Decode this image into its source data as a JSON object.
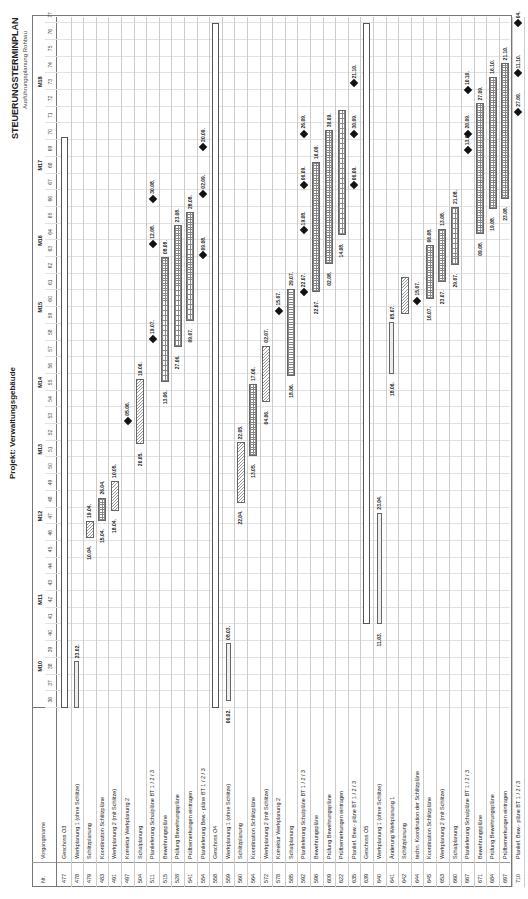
{
  "header": {
    "title": "STEUERUNGSTERMINPLAN",
    "subtitle": "Ausführungsplanung Rohbau",
    "project": "Projekt: Verwaltungsgebäude"
  },
  "columns": {
    "nr": "Nr.",
    "name": "Vorgangsname"
  },
  "timeline": {
    "weeks": [
      "36",
      "37",
      "38",
      "39",
      "40",
      "41",
      "42",
      "43",
      "44",
      "45",
      "46",
      "47",
      "48",
      "49",
      "50",
      "51",
      "52",
      "53",
      "54",
      "55",
      "56",
      "57",
      "58",
      "59",
      "60",
      "61",
      "62",
      "63",
      "64",
      "65",
      "66",
      "67",
      "68",
      "69",
      "70",
      "71",
      "72",
      "73",
      "74",
      "75",
      "76",
      "77"
    ],
    "months": [
      {
        "label": "M10",
        "week": 38.5
      },
      {
        "label": "M11",
        "week": 42.5
      },
      {
        "label": "M12",
        "week": 47.5
      },
      {
        "label": "M13",
        "week": 51.5
      },
      {
        "label": "M14",
        "week": 55.5
      },
      {
        "label": "M15",
        "week": 60
      },
      {
        "label": "M16",
        "week": 64
      },
      {
        "label": "M17",
        "week": 68.5
      },
      {
        "label": "M18",
        "week": 73.5
      }
    ]
  },
  "rows": [
    {
      "nr": "477",
      "name": "Geschoss O3"
    },
    {
      "nr": "478",
      "name": "Werkplanung 1 (ohne Schlitze)"
    },
    {
      "nr": "479",
      "name": "Schlitzplanung"
    },
    {
      "nr": "483",
      "name": "Koordination Schlitzpläne"
    },
    {
      "nr": "491",
      "name": "Werkplanung 2 (mit Schlitze)"
    },
    {
      "nr": "497",
      "name": "Korrektur Werkplanung 2"
    },
    {
      "nr": "504",
      "name": "Schalplanung"
    },
    {
      "nr": "511",
      "name": "Planlieferung Schalpläne BT 1 / 2 / 3"
    },
    {
      "nr": "515",
      "name": "Bewehrungspläne"
    },
    {
      "nr": "528",
      "name": "Prüfung Bewehrungspläne"
    },
    {
      "nr": "541",
      "name": "Prüfbemerkungen eintragen"
    },
    {
      "nr": "554",
      "name": "Planlieferung Bew.- pläne BT 1 / 2 / 3"
    },
    {
      "nr": "558",
      "name": "Geschoss O4"
    },
    {
      "nr": "559",
      "name": "Werkplanung 1 (ohne Schlitze)"
    },
    {
      "nr": "560",
      "name": "Schlitzplanung"
    },
    {
      "nr": "564",
      "name": "Koordination Schlitzpläne"
    },
    {
      "nr": "572",
      "name": "Werkplanung 2 (mit Schlitze)"
    },
    {
      "nr": "578",
      "name": "Korrektur Werkplanung 2"
    },
    {
      "nr": "585",
      "name": "Schalplanung"
    },
    {
      "nr": "592",
      "name": "Planlieferung Schalpläne BT 1 / 2 / 3"
    },
    {
      "nr": "596",
      "name": "Bewehrungspläne"
    },
    {
      "nr": "609",
      "name": "Prüfung Bewehrungspläne"
    },
    {
      "nr": "622",
      "name": "Prüfbemerkungen eintragen"
    },
    {
      "nr": "635",
      "name": "Planlief. Bew.- pläne BT 1 / 2 / 3"
    },
    {
      "nr": "639",
      "name": "Geschoss O5"
    },
    {
      "nr": "640",
      "name": "Werkplanung 1 (ohne Schlitze)"
    },
    {
      "nr": "641",
      "name": "Änderung Werkplanung 1"
    },
    {
      "nr": "642",
      "name": "Schlitzplanung"
    },
    {
      "nr": "644",
      "name": "techn. Koordination der Schlitzpläne"
    },
    {
      "nr": "645",
      "name": "Koordination Schlitzpläne"
    },
    {
      "nr": "653",
      "name": "Werkplanung 2 (mit Schlitze)"
    },
    {
      "nr": "660",
      "name": "Schalplanung"
    },
    {
      "nr": "667",
      "name": "Planlieferung Schalpläne BT 1 / 2 / 3"
    },
    {
      "nr": "671",
      "name": "Bewehrungspläne"
    },
    {
      "nr": "684",
      "name": "Prüfung Bewehrungspläne"
    },
    {
      "nr": "697",
      "name": "Prüfbemerkungen eintragen"
    },
    {
      "nr": "710",
      "name": "Planlief. Bew.- pläne BT 1 / 2 / 3"
    }
  ],
  "chart_data": {
    "type": "gantt",
    "title": "STEUERUNGSTERMINPLAN",
    "subtitle": "Ausführungsplanung Rohbau",
    "project": "Projekt: Verwaltungsgebäude",
    "x_axis": {
      "unit": "week",
      "range": [
        36,
        77
      ],
      "month_labels": [
        "M10",
        "M11",
        "M12",
        "M13",
        "M14",
        "M15",
        "M16",
        "M17",
        "M18"
      ]
    },
    "tasks": [
      {
        "row": 0,
        "type": "summary",
        "start_week": 36,
        "end_week": 70.2
      },
      {
        "row": 1,
        "type": "bar",
        "pattern": "thin",
        "start_week": 36,
        "end_week": 38.8,
        "end_label": "23.02."
      },
      {
        "row": 2,
        "type": "bar",
        "pattern": "hatch",
        "start_week": 46.2,
        "end_week": 47.2,
        "start_label": "10.04.",
        "end_label": "19.04."
      },
      {
        "row": 3,
        "type": "bar",
        "pattern": "grid",
        "start_week": 47.2,
        "end_week": 48.6,
        "start_label": "15.04.",
        "end_label": "26.04."
      },
      {
        "row": 4,
        "type": "bar",
        "pattern": "hatch",
        "start_week": 47.8,
        "end_week": 49.6,
        "start_label": "18.04.",
        "end_label": "10.05."
      },
      {
        "row": 5,
        "type": "milestone",
        "week": 53.2,
        "label": "05.06."
      },
      {
        "row": 6,
        "type": "milestone",
        "week": 54.3,
        "label": "12.06."
      },
      {
        "row": 6,
        "type": "bar",
        "pattern": "hatch",
        "start_week": 51.8,
        "end_week": 55.7,
        "start_label": "20.05.",
        "end_label": "19.06."
      },
      {
        "row": 7,
        "type": "milestone",
        "week": 58.1,
        "label": "19.07."
      },
      {
        "row": 8,
        "type": "bar",
        "pattern": "grid",
        "start_week": 55.5,
        "end_week": 63.0,
        "start_label": "13.06.",
        "end_label": "08.08."
      },
      {
        "row": 9,
        "type": "bar",
        "pattern": "grid",
        "start_week": 57.6,
        "end_week": 64.9,
        "start_label": "27.06.",
        "end_label": "23.08."
      },
      {
        "row": 10,
        "type": "bar",
        "pattern": "grid",
        "start_week": 59.2,
        "end_week": 65.7,
        "start_label": "09.07.",
        "end_label": "28.08."
      },
      {
        "row": 7,
        "type": "milestone",
        "week": 63.8,
        "label": "12.08."
      },
      {
        "row": 7,
        "type": "milestone",
        "week": 66.5,
        "label": "30.08."
      },
      {
        "row": 11,
        "type": "milestone",
        "week": 63.1,
        "label": "09.08."
      },
      {
        "row": 11,
        "type": "milestone",
        "week": 66.8,
        "label": "02.09."
      },
      {
        "row": 11,
        "type": "milestone",
        "week": 69.6,
        "label": "20.09."
      },
      {
        "row": 12,
        "type": "summary",
        "start_week": 36,
        "end_week": 77
      },
      {
        "row": 13,
        "type": "bar",
        "pattern": "thin",
        "start_week": 36.4,
        "end_week": 39.9,
        "start_label": "06.02.",
        "end_label": "08.03."
      },
      {
        "row": 14,
        "type": "bar",
        "pattern": "hatch",
        "start_week": 48.3,
        "end_week": 51.9,
        "start_label": "22.04.",
        "end_label": "22.05."
      },
      {
        "row": 15,
        "type": "bar",
        "pattern": "grid",
        "start_week": 51.1,
        "end_week": 55.4,
        "start_label": "13.05.",
        "end_label": "17.06."
      },
      {
        "row": 16,
        "type": "bar",
        "pattern": "hatch",
        "start_week": 54.3,
        "end_week": 57.7,
        "start_label": "04.06.",
        "end_label": "02.07."
      },
      {
        "row": 17,
        "type": "milestone",
        "week": 59.8,
        "label": "15.07."
      },
      {
        "row": 18,
        "type": "bar",
        "pattern": "grid",
        "start_week": 55.9,
        "end_week": 61.1,
        "start_label": "18.06.",
        "end_label": "29.07."
      },
      {
        "row": 19,
        "type": "milestone",
        "week": 60.9,
        "label": "22.07."
      },
      {
        "row": 19,
        "type": "milestone",
        "week": 64.6,
        "label": "19.08."
      },
      {
        "row": 19,
        "type": "milestone",
        "week": 67.3,
        "label": "06.09."
      },
      {
        "row": 19,
        "type": "milestone",
        "week": 70.4,
        "label": "26.09."
      },
      {
        "row": 20,
        "type": "bar",
        "pattern": "grid",
        "start_week": 60.9,
        "end_week": 68.7,
        "start_label": "22.07.",
        "end_label": "16.09."
      },
      {
        "row": 21,
        "type": "bar",
        "pattern": "grid",
        "start_week": 62.6,
        "end_week": 70.6,
        "start_label": "02.08.",
        "end_label": "30.09."
      },
      {
        "row": 22,
        "type": "bar",
        "pattern": "grid",
        "start_week": 64.3,
        "end_week": 71.8,
        "start_label": "14.08."
      },
      {
        "row": 23,
        "type": "milestone",
        "week": 67.3,
        "label": "06.09."
      },
      {
        "row": 23,
        "type": "milestone",
        "week": 70.4,
        "label": "30.09."
      },
      {
        "row": 23,
        "type": "milestone",
        "week": 73.4,
        "label": "21.10."
      },
      {
        "row": 24,
        "type": "summary",
        "start_week": 41.0,
        "end_week": 77
      },
      {
        "row": 25,
        "type": "bar",
        "pattern": "thin",
        "start_week": 41.0,
        "end_week": 47.7,
        "start_label": "11.03.",
        "end_label": "23.04."
      },
      {
        "row": 26,
        "type": "bar",
        "pattern": "thin",
        "start_week": 56.0,
        "end_week": 59.1,
        "start_label": "18.06.",
        "end_label": "05.07."
      },
      {
        "row": 27,
        "type": "bar",
        "pattern": "hatch",
        "start_week": 59.6,
        "end_week": 61.8
      },
      {
        "row": 28,
        "type": "milestone",
        "week": 60.4,
        "label": "15.07."
      },
      {
        "row": 29,
        "type": "bar",
        "pattern": "grid",
        "start_week": 60.5,
        "end_week": 63.7,
        "start_label": "16.07.",
        "end_label": "06.08."
      },
      {
        "row": 30,
        "type": "bar",
        "pattern": "grid",
        "start_week": 61.5,
        "end_week": 64.7,
        "start_label": "23.07.",
        "end_label": "13.08."
      },
      {
        "row": 31,
        "type": "bar",
        "pattern": "grid",
        "start_week": 62.5,
        "end_week": 66.0,
        "start_label": "29.07.",
        "end_label": "21.08."
      },
      {
        "row": 32,
        "type": "milestone",
        "week": 69.4,
        "label": "13.09."
      },
      {
        "row": 32,
        "type": "milestone",
        "week": 70.4,
        "label": "20.09."
      },
      {
        "row": 32,
        "type": "milestone",
        "week": 73.0,
        "label": "10.10."
      },
      {
        "row": 33,
        "type": "bar",
        "pattern": "grid",
        "start_week": 64.4,
        "end_week": 72.2,
        "start_label": "09.08.",
        "end_label": "27.09."
      },
      {
        "row": 34,
        "type": "bar",
        "pattern": "grid",
        "start_week": 65.9,
        "end_week": 73.8,
        "start_label": "19.08.",
        "end_label": "16.10."
      },
      {
        "row": 35,
        "type": "bar",
        "pattern": "grid",
        "start_week": 66.5,
        "end_week": 74.6,
        "start_label": "23.08.",
        "end_label": "21.10."
      },
      {
        "row": 36,
        "type": "milestone",
        "week": 71.7,
        "label": "27.09."
      },
      {
        "row": 36,
        "type": "milestone",
        "week": 74.0,
        "label": "11.10."
      },
      {
        "row": 36,
        "type": "milestone",
        "week": 77.0,
        "label": "04."
      }
    ]
  }
}
